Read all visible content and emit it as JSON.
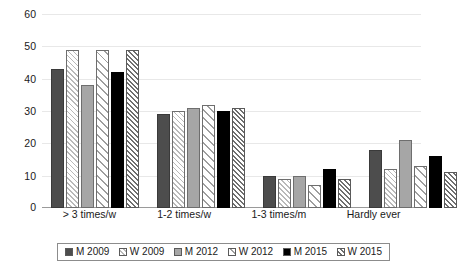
{
  "chart_data": {
    "type": "bar",
    "title": "",
    "xlabel": "",
    "ylabel": "",
    "ylim": [
      0,
      60
    ],
    "yticks": [
      0,
      10,
      20,
      30,
      40,
      50,
      60
    ],
    "ytick_labels": [
      "0",
      "10",
      "20",
      "30",
      "40",
      "50",
      "60"
    ],
    "grid": true,
    "legend_position": "bottom",
    "categories": [
      "> 3 times/w",
      "1-2 times/w",
      "1-3 times/m",
      "Hardly ever"
    ],
    "series": [
      {
        "name": "M 2009",
        "pattern": "solid-dark-gray",
        "color": "#4d4d4d",
        "values": [
          43,
          29,
          10,
          18
        ]
      },
      {
        "name": "W 2009",
        "pattern": "hatch-light",
        "color": "#ffffff",
        "values": [
          49,
          30,
          9,
          12
        ]
      },
      {
        "name": "M 2012",
        "pattern": "solid-mid-gray",
        "color": "#a6a6a6",
        "values": [
          38,
          31,
          10,
          21
        ]
      },
      {
        "name": "W 2012",
        "pattern": "hatch-wide",
        "color": "#ffffff",
        "values": [
          49,
          32,
          7,
          13
        ]
      },
      {
        "name": "M 2015",
        "pattern": "solid-black",
        "color": "#000000",
        "values": [
          42,
          30,
          12,
          16
        ]
      },
      {
        "name": "W 2015",
        "pattern": "hatch-dense",
        "color": "#ffffff",
        "values": [
          49,
          31,
          9,
          11
        ]
      }
    ]
  }
}
